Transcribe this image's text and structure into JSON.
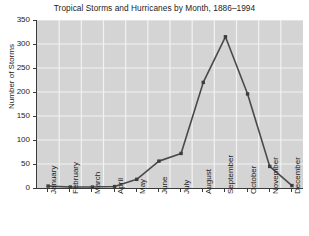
{
  "chart_data": {
    "type": "line",
    "title": "Tropical Storms and Hurricanes by Month, 1886–1994",
    "xlabel": "",
    "ylabel": "Number of Storms",
    "categories": [
      "January",
      "February",
      "March",
      "April",
      "May",
      "June",
      "July",
      "August",
      "September",
      "October",
      "November",
      "December"
    ],
    "values": [
      4,
      2,
      2,
      3,
      18,
      56,
      72,
      220,
      315,
      196,
      45,
      5
    ],
    "series": [
      {
        "name": "Number of Storms",
        "values": [
          4,
          2,
          2,
          3,
          18,
          56,
          72,
          220,
          315,
          196,
          45,
          5
        ]
      }
    ],
    "ylim": [
      0,
      350
    ],
    "yticks": [
      0,
      50,
      100,
      150,
      200,
      250,
      300,
      350
    ],
    "ytick_labels": [
      "0",
      "50",
      "100",
      "150",
      "200",
      "250",
      "300",
      "350"
    ],
    "grid": true,
    "legend": false,
    "legend_position": "none",
    "colors": {
      "line": "#4a4a4a",
      "marker": "#3c3c3c",
      "plot_background": "#d4d4d4",
      "gridlines": "#f2f2f2",
      "axis": "#3a3a3a",
      "page_background": "#ffffff",
      "text": "#1c1c1c"
    }
  }
}
